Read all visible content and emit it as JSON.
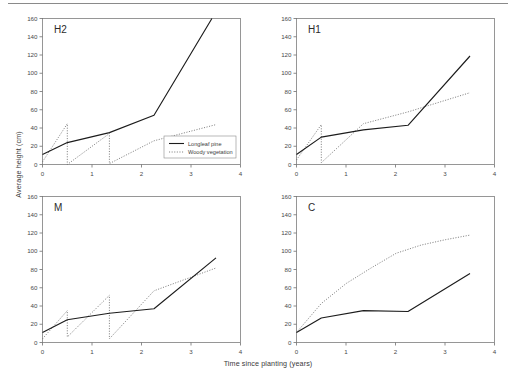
{
  "figure": {
    "ylabel": "Average height (cm)",
    "xlabel": "Time since planting (years)"
  },
  "legend": {
    "items": [
      {
        "label": "Longleaf pine",
        "style": "solid"
      },
      {
        "label": "Woody vegetation",
        "style": "dotted"
      }
    ]
  },
  "axis": {
    "x_ticks": [
      "0",
      "1",
      "2",
      "3",
      "4"
    ],
    "y_ticks": [
      "0",
      "20",
      "40",
      "60",
      "80",
      "100",
      "120",
      "140",
      "160"
    ]
  },
  "chart_data": {
    "type": "line",
    "xlabel": "Time since planting (years)",
    "ylabel": "Average height (cm)",
    "xlim": [
      0,
      4
    ],
    "ylim": [
      0,
      160
    ],
    "xticks": [
      0,
      1,
      2,
      3,
      4
    ],
    "yticks": [
      0,
      20,
      40,
      60,
      80,
      100,
      120,
      140,
      160
    ],
    "grid": false,
    "legend_position": "inside-bottom-right-of-panel-H2",
    "panels": [
      {
        "label": "H2",
        "position": "top-left",
        "series": [
          {
            "name": "Longleaf pine",
            "style": "solid",
            "x": [
              0.0,
              0.5,
              1.35,
              2.25,
              3.42
            ],
            "y": [
              11,
              24,
              35,
              54,
              160
            ]
          },
          {
            "name": "Woody vegetation",
            "style": "dotted",
            "x": [
              0.0,
              0.5,
              0.5,
              1.35,
              1.35,
              2.25,
              3.5
            ],
            "y": [
              3,
              45,
              0,
              34,
              1,
              26,
              44
            ]
          }
        ]
      },
      {
        "label": "H1",
        "position": "top-right",
        "series": [
          {
            "name": "Longleaf pine",
            "style": "solid",
            "x": [
              0.0,
              0.5,
              1.35,
              2.25,
              3.5
            ],
            "y": [
              11,
              30,
              38,
              43,
              119
            ]
          },
          {
            "name": "Woody vegetation",
            "style": "dotted",
            "x": [
              0.0,
              0.5,
              0.5,
              1.35,
              2.25,
              3.5
            ],
            "y": [
              5,
              44,
              2,
              45,
              58,
              79
            ]
          }
        ]
      },
      {
        "label": "M",
        "position": "bottom-left",
        "series": [
          {
            "name": "Longleaf pine",
            "style": "solid",
            "x": [
              0.0,
              0.5,
              1.35,
              2.25,
              3.5
            ],
            "y": [
              11,
              25,
              32,
              37,
              93
            ]
          },
          {
            "name": "Woody vegetation",
            "style": "dotted",
            "x": [
              0.0,
              0.5,
              0.5,
              1.35,
              1.35,
              2.25,
              3.5
            ],
            "y": [
              4,
              35,
              6,
              52,
              4,
              57,
              81
            ]
          }
        ]
      },
      {
        "label": "C",
        "position": "bottom-right",
        "series": [
          {
            "name": "Longleaf pine",
            "style": "solid",
            "x": [
              0.0,
              0.5,
              1.35,
              2.25,
              3.5
            ],
            "y": [
              11,
              27,
              35,
              34,
              76
            ]
          },
          {
            "name": "Woody vegetation",
            "style": "dotted",
            "x": [
              0.0,
              0.5,
              1.0,
              1.5,
              2.0,
              2.5,
              3.0,
              3.5
            ],
            "y": [
              11,
              43,
              65,
              82,
              98,
              107,
              113,
              118
            ]
          }
        ]
      }
    ]
  }
}
